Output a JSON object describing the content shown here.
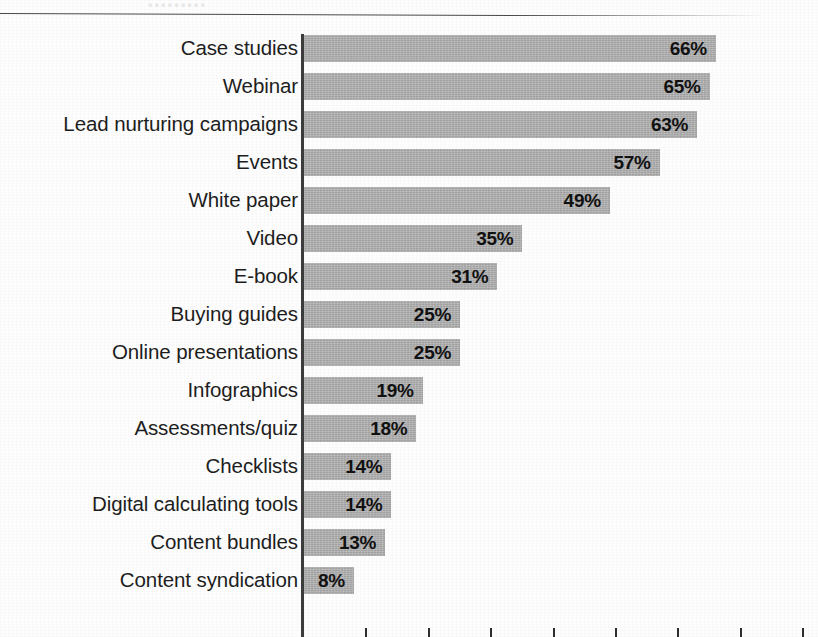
{
  "page": {
    "ghost_text": "•••••••••",
    "background_color": "#fdfdfd"
  },
  "chart_data": {
    "type": "bar",
    "orientation": "horizontal",
    "title": "",
    "subtitle": "",
    "xlabel": "",
    "ylabel": "",
    "xlim": [
      0,
      70
    ],
    "grid": false,
    "legend": null,
    "bar_color": "#b2b2b2",
    "value_suffix": "%",
    "categories": [
      "Case studies",
      "Webinar",
      "Lead nurturing campaigns",
      "Events",
      "White paper",
      "Video",
      "E-book",
      "Buying guides",
      "Online presentations",
      "Infographics",
      "Assessments/quiz",
      "Checklists",
      "Digital calculating tools",
      "Content bundles",
      "Content syndication"
    ],
    "values": [
      66,
      65,
      63,
      57,
      49,
      35,
      31,
      25,
      25,
      19,
      18,
      14,
      14,
      13,
      8
    ],
    "value_labels": [
      "66%",
      "65%",
      "63%",
      "57%",
      "49%",
      "35%",
      "31%",
      "25%",
      "25%",
      "19%",
      "18%",
      "14%",
      "14%",
      "13%",
      "8%"
    ],
    "xticks": [
      10,
      20,
      30,
      40,
      50,
      60,
      70,
      80
    ],
    "xticklabels": []
  }
}
